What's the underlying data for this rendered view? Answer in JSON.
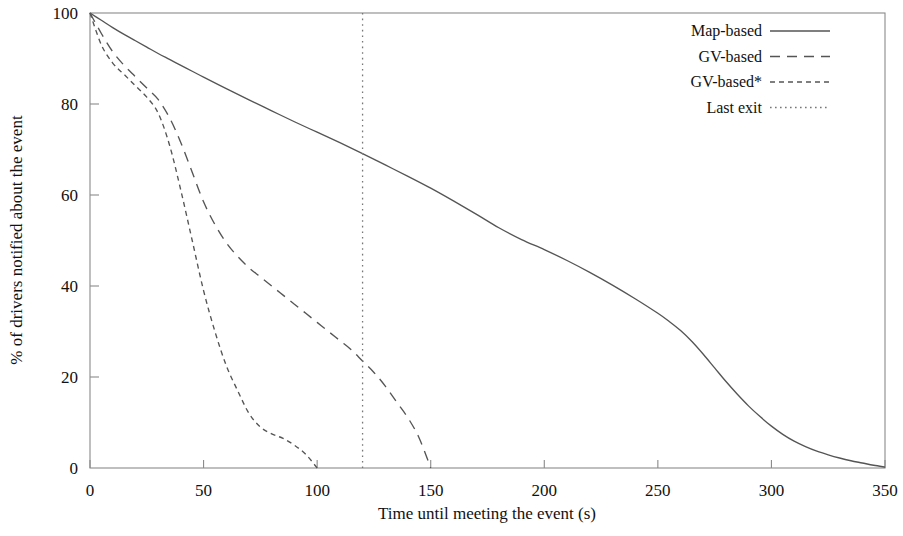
{
  "chart_data": {
    "type": "line",
    "title": "",
    "xlabel": "Time until meeting the event (s)",
    "ylabel": "% of drivers notified about the event",
    "xlim": [
      0,
      350
    ],
    "ylim": [
      0,
      100
    ],
    "xticks": [
      0,
      50,
      100,
      150,
      200,
      250,
      300,
      350
    ],
    "yticks": [
      0,
      20,
      40,
      60,
      80,
      100
    ],
    "xtick_labels": [
      "0",
      "50",
      "100",
      "150",
      "200",
      "250",
      "300",
      "350"
    ],
    "ytick_labels": [
      "0",
      "20",
      "40",
      "60",
      "80",
      "100"
    ],
    "grid": false,
    "legend_position": "top-right",
    "series": [
      {
        "name": "Map-based",
        "style": "solid",
        "dash": "none",
        "color": "#555555",
        "x": [
          0,
          5,
          10,
          15,
          20,
          25,
          30,
          35,
          40,
          45,
          50,
          60,
          70,
          80,
          90,
          100,
          110,
          120,
          130,
          140,
          150,
          160,
          170,
          180,
          190,
          200,
          210,
          220,
          230,
          240,
          250,
          255,
          260,
          265,
          270,
          275,
          280,
          285,
          290,
          295,
          300,
          305,
          310,
          315,
          320,
          325,
          330,
          335,
          340,
          345,
          350
        ],
        "y": [
          100,
          98.4,
          96.8,
          95.3,
          93.9,
          92.5,
          91.1,
          89.8,
          88.5,
          87.2,
          85.9,
          83.4,
          80.9,
          78.5,
          76.1,
          73.8,
          71.5,
          69.1,
          66.6,
          64.1,
          61.5,
          58.7,
          55.8,
          52.8,
          50.2,
          48.0,
          45.6,
          43.0,
          40.2,
          37.2,
          34.0,
          32.2,
          30.2,
          27.8,
          25.0,
          22.0,
          19.0,
          16.2,
          13.6,
          11.3,
          9.2,
          7.4,
          5.9,
          4.7,
          3.7,
          2.9,
          2.2,
          1.6,
          1.1,
          0.6,
          0.2
        ]
      },
      {
        "name": "GV-based",
        "style": "dashed",
        "dash": "10 7",
        "color": "#555555",
        "x": [
          0,
          5,
          10,
          15,
          20,
          25,
          30,
          35,
          40,
          45,
          50,
          55,
          60,
          65,
          70,
          75,
          80,
          85,
          90,
          95,
          100,
          105,
          110,
          115,
          120,
          125,
          130,
          135,
          140,
          145,
          150
        ],
        "y": [
          100,
          95.5,
          91.5,
          88.5,
          86.0,
          83.5,
          81.0,
          77.0,
          71.5,
          65.0,
          58.5,
          53.5,
          49.5,
          46.5,
          44.0,
          42.0,
          40.0,
          38.0,
          36.0,
          34.0,
          32.0,
          30.0,
          28.0,
          26.0,
          23.5,
          21.0,
          18.0,
          14.5,
          11.0,
          6.5,
          0.0
        ]
      },
      {
        "name": "GV-based*",
        "style": "short-dashed",
        "dash": "5 4",
        "color": "#555555",
        "x": [
          0,
          5,
          10,
          15,
          20,
          25,
          30,
          35,
          40,
          45,
          50,
          55,
          60,
          65,
          70,
          75,
          80,
          85,
          90,
          95,
          100
        ],
        "y": [
          100,
          93.0,
          89.0,
          86.5,
          84.0,
          81.5,
          78.0,
          71.0,
          61.0,
          50.0,
          39.0,
          30.0,
          22.5,
          17.0,
          12.0,
          9.0,
          7.5,
          6.5,
          5.0,
          3.0,
          0.0
        ]
      },
      {
        "name": "Last exit",
        "style": "dotted",
        "dash": "1.6 4",
        "color": "#777777",
        "type": "vertical-line",
        "x_value": 120
      }
    ],
    "annotations": [
      {
        "text": "Map-based crosses last-exit line at ~64%",
        "x": 120,
        "y": 64
      },
      {
        "text": "GV-based crosses last-exit line at ~16%",
        "x": 120,
        "y": 16
      }
    ]
  },
  "legend": {
    "entries": [
      {
        "label": "Map-based",
        "style": "solid"
      },
      {
        "label": "GV-based",
        "style": "dashed"
      },
      {
        "label": "GV-based*",
        "style": "short-dashed"
      },
      {
        "label": "Last exit",
        "style": "dotted"
      }
    ]
  }
}
